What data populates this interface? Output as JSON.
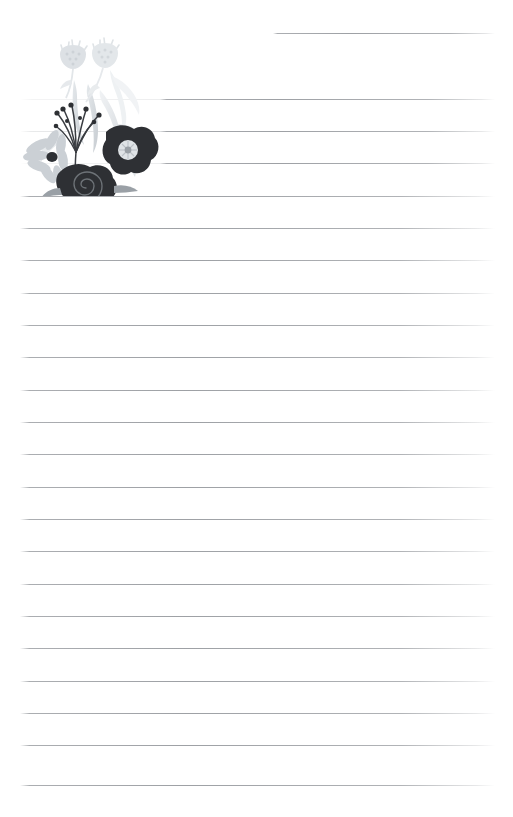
{
  "page": {
    "kind": "lined-stationery-sheet",
    "width": 513,
    "height": 817,
    "background_color": "#ffffff",
    "text_content": "",
    "title": "",
    "heading": ""
  },
  "ruled_lines": {
    "count": 24,
    "line_color": "#787c82",
    "faint_line_color": "#8c9096",
    "left_margin_x": 20,
    "right_margin_x": 495,
    "spacing_px": 32.3,
    "first_line_y": 33,
    "lines": [
      {
        "index": 1,
        "y": 33,
        "x_start": 273,
        "x_end": 495,
        "style": "normal"
      },
      {
        "index": 2,
        "y": 99,
        "x_start": 160,
        "x_end": 495,
        "style": "normal"
      },
      {
        "index": 3,
        "y": 131,
        "x_start": 160,
        "x_end": 495,
        "style": "normal"
      },
      {
        "index": 4,
        "y": 163,
        "x_start": 160,
        "x_end": 495,
        "style": "normal"
      },
      {
        "index": 5,
        "y": 196,
        "x_start": 20,
        "x_end": 495,
        "style": "normal"
      },
      {
        "index": 6,
        "y": 228,
        "x_start": 20,
        "x_end": 495,
        "style": "normal"
      },
      {
        "index": 7,
        "y": 260,
        "x_start": 20,
        "x_end": 495,
        "style": "normal"
      },
      {
        "index": 8,
        "y": 293,
        "x_start": 20,
        "x_end": 495,
        "style": "normal"
      },
      {
        "index": 9,
        "y": 325,
        "x_start": 20,
        "x_end": 495,
        "style": "normal"
      },
      {
        "index": 10,
        "y": 357,
        "x_start": 20,
        "x_end": 495,
        "style": "normal"
      },
      {
        "index": 11,
        "y": 390,
        "x_start": 20,
        "x_end": 495,
        "style": "normal"
      },
      {
        "index": 12,
        "y": 422,
        "x_start": 20,
        "x_end": 495,
        "style": "normal"
      },
      {
        "index": 13,
        "y": 454,
        "x_start": 20,
        "x_end": 495,
        "style": "normal"
      },
      {
        "index": 14,
        "y": 487,
        "x_start": 20,
        "x_end": 495,
        "style": "normal"
      },
      {
        "index": 15,
        "y": 519,
        "x_start": 20,
        "x_end": 495,
        "style": "normal"
      },
      {
        "index": 16,
        "y": 551,
        "x_start": 20,
        "x_end": 495,
        "style": "normal"
      },
      {
        "index": 17,
        "y": 584,
        "x_start": 20,
        "x_end": 495,
        "style": "normal"
      },
      {
        "index": 18,
        "y": 616,
        "x_start": 20,
        "x_end": 495,
        "style": "normal"
      },
      {
        "index": 19,
        "y": 648,
        "x_start": 20,
        "x_end": 495,
        "style": "normal"
      },
      {
        "index": 20,
        "y": 681,
        "x_start": 20,
        "x_end": 495,
        "style": "normal"
      },
      {
        "index": 21,
        "y": 713,
        "x_start": 20,
        "x_end": 495,
        "style": "normal"
      },
      {
        "index": 22,
        "y": 745,
        "x_start": 20,
        "x_end": 495,
        "style": "normal"
      },
      {
        "index": 23,
        "y": 785,
        "x_start": 20,
        "x_end": 495,
        "style": "normal"
      },
      {
        "index": 24,
        "y": 131,
        "x_start": 20,
        "x_end": 275,
        "style": "faint"
      }
    ],
    "faint_overlay_lines": [
      {
        "index": 1,
        "y": 99,
        "x_start": 20,
        "x_end": 330
      },
      {
        "index": 2,
        "y": 131,
        "x_start": 20,
        "x_end": 330
      },
      {
        "index": 3,
        "y": 163,
        "x_start": 20,
        "x_end": 330
      }
    ]
  },
  "artwork": {
    "name": "floral-bouquet-illustration",
    "description": "Grayscale flower bouquet in the upper-left corner",
    "position": {
      "x": 14,
      "y": 28,
      "width": 150,
      "height": 168
    },
    "palette": {
      "darkest": "#2e3034",
      "dark": "#3a3d42",
      "mid_gray": "#9aa0a6",
      "light_gray": "#c9ced3",
      "pale_gray": "#dfe3e6",
      "very_pale": "#eceff1",
      "highlight": "#f4f6f7"
    },
    "elements": [
      {
        "name": "thistle-bloom-left",
        "color": "#dfe3e6",
        "kind": "flower"
      },
      {
        "name": "thistle-bloom-right",
        "color": "#dfe3e6",
        "kind": "flower"
      },
      {
        "name": "daisy-flower",
        "color": "#c9ced3",
        "kind": "flower",
        "center_color": "#2e3034"
      },
      {
        "name": "poppy-flower",
        "color": "#2e3034",
        "kind": "flower",
        "center_color": "#dfe3e6"
      },
      {
        "name": "spiral-rose",
        "color": "#2e3034",
        "kind": "flower"
      },
      {
        "name": "berry-stems",
        "color": "#3a3d42",
        "kind": "stems"
      },
      {
        "name": "long-leaves",
        "color": "#dfe3e6",
        "kind": "foliage"
      },
      {
        "name": "fern-frond",
        "color": "#eceff1",
        "kind": "foliage"
      }
    ]
  }
}
